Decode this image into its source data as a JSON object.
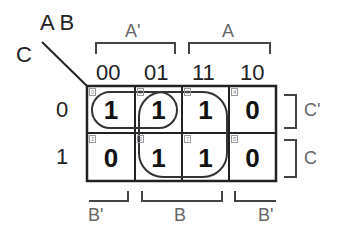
{
  "kmap": {
    "corner": {
      "row_vars": "C",
      "col_vars": "A B"
    },
    "col_headers": [
      "00",
      "01",
      "11",
      "10"
    ],
    "row_headers": [
      "0",
      "1"
    ],
    "top_brackets": [
      {
        "label": "A'"
      },
      {
        "label": "A"
      }
    ],
    "bottom_brackets": [
      {
        "label": "B'"
      },
      {
        "label": "B"
      },
      {
        "label": "B'"
      }
    ],
    "right_brackets": [
      {
        "label": "C'"
      },
      {
        "label": "C"
      }
    ],
    "cells": [
      [
        {
          "index": "0",
          "value": "1"
        },
        {
          "index": "2",
          "value": "1"
        },
        {
          "index": "6",
          "value": "1"
        },
        {
          "index": "4",
          "value": "0"
        }
      ],
      [
        {
          "index": "1",
          "value": "0"
        },
        {
          "index": "3",
          "value": "1"
        },
        {
          "index": "7",
          "value": "1"
        },
        {
          "index": "5",
          "value": "0"
        }
      ]
    ],
    "colors": {
      "line": "#222222",
      "bracket": "#444444",
      "label_grey": "#666666"
    }
  }
}
